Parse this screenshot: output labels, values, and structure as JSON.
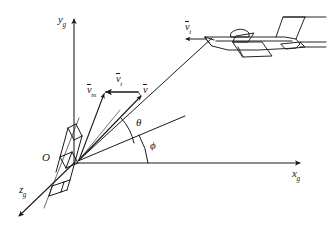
{
  "figure": {
    "background_color": "#ffffff",
    "line_color": "#1a1a1a",
    "width": 328,
    "height": 235
  },
  "axes": {
    "x_label": "x",
    "x_subscript": "g",
    "y_label": "y",
    "y_subscript": "g",
    "z_label": "z",
    "z_subscript": "g",
    "origin_label": "O"
  },
  "angles": [
    {
      "name": "theta",
      "symbol": "θ",
      "description": "angle between line of sight and reference line"
    },
    {
      "name": "phi",
      "symbol": "ϕ",
      "description": "angle between reference line and x-axis"
    }
  ],
  "vectors": [
    {
      "name": "missile-velocity",
      "symbol": "v",
      "subscript": "m",
      "direction": "up-left"
    },
    {
      "name": "relative-velocity",
      "symbol": "v",
      "subscript": "t",
      "direction": "left"
    },
    {
      "name": "closing-velocity",
      "symbol": "v",
      "subscript": "",
      "direction": "up-right"
    },
    {
      "name": "target-velocity",
      "symbol": "v",
      "subscript": "t",
      "direction": "left"
    }
  ],
  "objects": [
    {
      "name": "missile",
      "location": "origin",
      "description": "missile body at origin, tilted"
    },
    {
      "name": "aircraft",
      "location": "upper-right",
      "description": "target aircraft"
    }
  ]
}
